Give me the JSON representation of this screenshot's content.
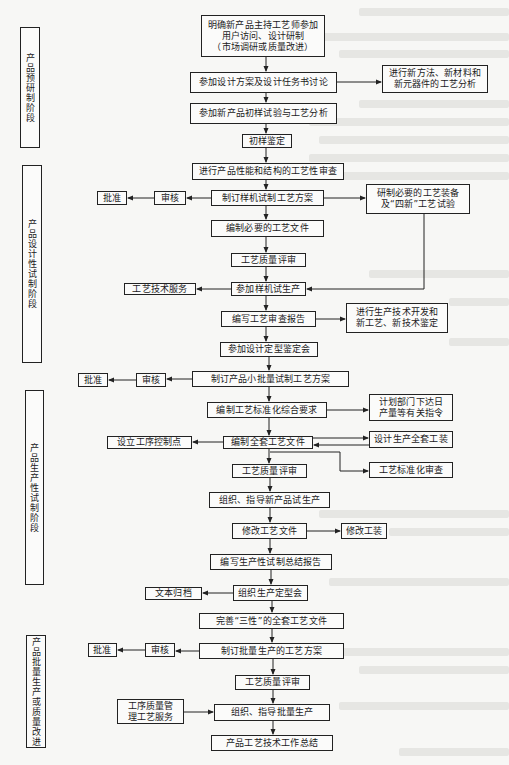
{
  "stages": [
    {
      "label": "产品预研制阶段"
    },
    {
      "label": "产品设计性试制阶段"
    },
    {
      "label": "产品生产性试制阶段"
    },
    {
      "label": "产品批量生产或质量改进"
    }
  ],
  "nodes": {
    "n1": "明确新产品主持工艺师参加\n用户访问、设计研制\n（市场调研或质量改进）",
    "n2": "参加设计方案及设计任务书讨论",
    "n2r": "进行新方法、新材料和\n新元器件的工艺分析",
    "n3": "参加新产品初样试验与工艺分析",
    "n4": "初样鉴定",
    "n5": "进行产品性能和结构的工艺性审查",
    "n6": "制订样机试制工艺方案",
    "n6a": "审核",
    "n6b": "批准",
    "n6r": "研制必要的工艺装备\n及“四新”工艺试验",
    "n7": "编制必要的工艺文件",
    "n8": "工艺质量评审",
    "n9": "参加样机试生产",
    "n9l": "工艺技术服务",
    "n10": "编写工艺审查报告",
    "n10r": "进行生产技术开发和\n新工艺、新技术鉴定",
    "n11": "参加设计定型鉴定会",
    "n12": "制订产品小批量试制工艺方案",
    "n12a": "审核",
    "n12b": "批准",
    "n13": "编制工艺标准化综合要求",
    "n13r": "计划部门下达日\n产量等有关指令",
    "n14": "编制全套工艺文件",
    "n14l": "设立工序控制点",
    "n14r": "设计生产全套工装",
    "n14s": "工艺标准化审查",
    "n15": "工艺质量评审",
    "n16": "组织、指导新产品试生产",
    "n17": "修改工艺文件",
    "n17r": "修改工装",
    "n18": "编写生产性试制总结报告",
    "n19": "组织生产定型会",
    "n19l": "文本归档",
    "n20": "完善“三性”的全套工艺文件",
    "n21": "制订批量生产的工艺方案",
    "n21a": "审核",
    "n21b": "批准",
    "n22": "工艺质量评审",
    "n23": "组织、指导批量生产",
    "n23l": "工序质量管\n理工艺服务",
    "n24": "产品工艺技术工作总结"
  },
  "colors": {
    "line": "#222222",
    "background": "#f7f7f5"
  }
}
